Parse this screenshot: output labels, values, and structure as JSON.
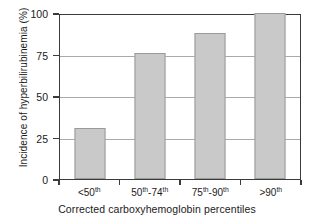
{
  "chart_data": {
    "type": "bar",
    "title": "",
    "categories": [
      "<50th",
      "50th-74th",
      "75th-90th",
      ">90th"
    ],
    "category_labels_html": [
      "&lt;50<sup>th</sup>",
      "50<sup>th</sup>-74<sup>th</sup>",
      "75<sup>th</sup>-90<sup>th</sup>",
      "&gt;90<sup>th</sup>"
    ],
    "values": [
      31,
      76,
      88,
      100
    ],
    "xlabel": "Corrected carboxyhemoglobin percentiles",
    "ylabel": "Incidence of hyperbilirubinemia (%)",
    "ylim": [
      0,
      100
    ],
    "yticks": [
      0,
      25,
      50,
      75,
      100
    ],
    "ytick_labels": [
      "0",
      "25",
      "50",
      "75",
      "100"
    ],
    "grid": "horizontal",
    "legend": "none",
    "bar_fill_color": "#c9c9c9",
    "bar_edge_color": "#9a9a9a",
    "axis_color": "#3b3b3b",
    "gridline_color": "#a9a9a9",
    "background_color": "#ffffff"
  }
}
